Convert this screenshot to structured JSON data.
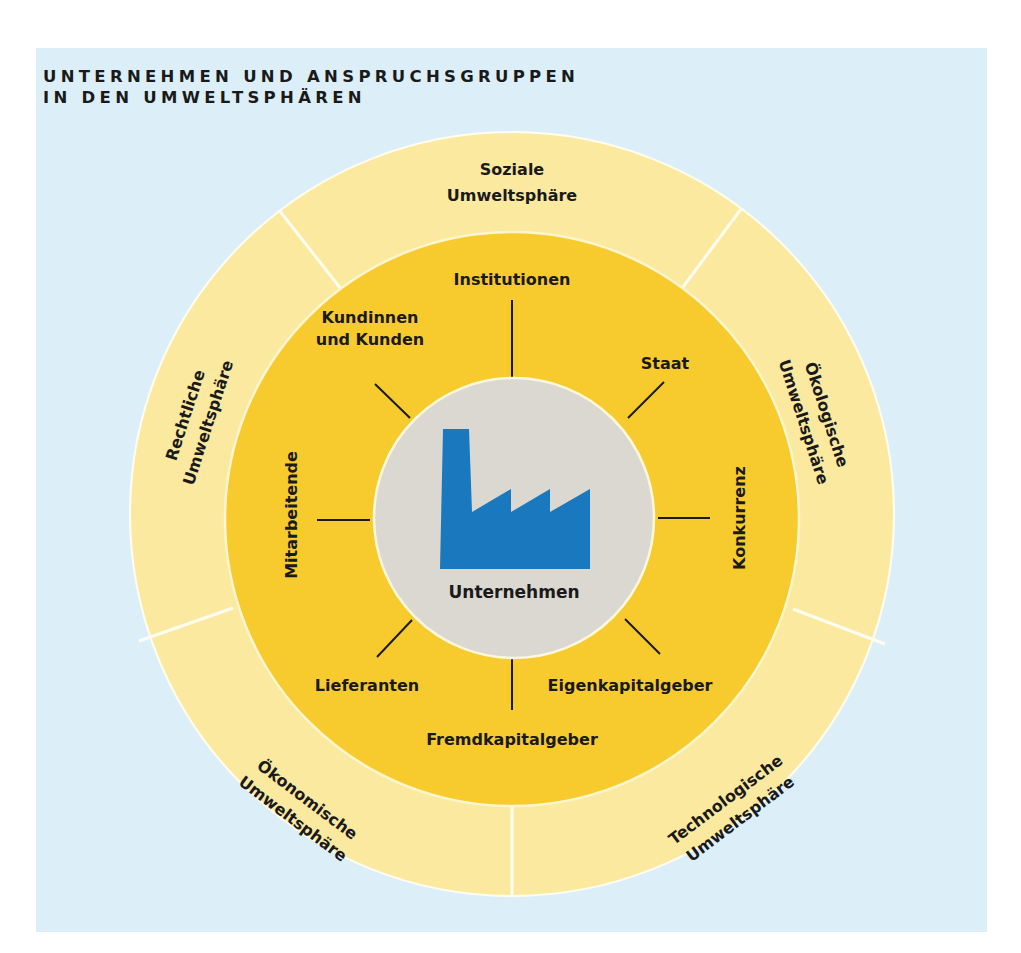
{
  "title": {
    "line1": "UNTERNEHMEN UND ANSPRUCHSGRUPPEN",
    "line2": "IN DEN UMWELTSPHÄREN"
  },
  "colors": {
    "panel_background": "#DCEFF8",
    "outer_ring": "#FBE9A0",
    "inner_ring": "#F7CB2E",
    "center_circle": "#DAD8D1",
    "factory_icon": "#1A78BE",
    "divider": "#FFFDF0",
    "connector": "#1a1a1a"
  },
  "center": {
    "icon": "factory-icon",
    "label": "Unternehmen"
  },
  "stakeholders": {
    "institutionen": "Institutionen",
    "kunden_line1": "Kundinnen",
    "kunden_line2": "und Kunden",
    "staat": "Staat",
    "mitarbeitende": "Mitarbeitende",
    "konkurrenz": "Konkurrenz",
    "lieferanten": "Lieferanten",
    "eigenkapitalgeber": "Eigenkapitalgeber",
    "fremdkapitalgeber": "Fremdkapitalgeber"
  },
  "spheres": {
    "soziale": {
      "line1": "Soziale",
      "line2": "Umweltsphäre"
    },
    "oekologische": {
      "line1": "Ökologische",
      "line2": "Umweltsphäre"
    },
    "technologische": {
      "line1": "Technologische",
      "line2": "Umweltsphäre"
    },
    "oekonomische": {
      "line1": "Ökonomische",
      "line2": "Umweltsphäre"
    },
    "rechtliche": {
      "line1": "Rechtliche",
      "line2": "Umweltsphäre"
    }
  }
}
